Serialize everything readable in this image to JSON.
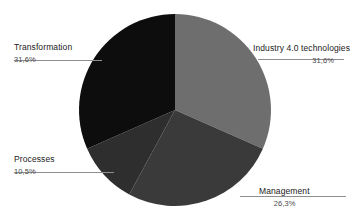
{
  "chart_data": {
    "type": "pie",
    "title": "",
    "labels": [
      "Industry 4.0  technologies",
      "Management",
      "Processes",
      "Transformation"
    ],
    "values": [
      31.6,
      26.3,
      10.5,
      31.6
    ],
    "value_labels": [
      "31,6%",
      "26,3%",
      "10,5%",
      "31,6%"
    ],
    "colors": [
      "#6e6e6e",
      "#3a3a3a",
      "#2e2e2e",
      "#0d0d0d"
    ],
    "start_angle_deg": 0,
    "direction": "clockwise",
    "legend": "none",
    "grid": false,
    "slices": [
      {
        "name": "Industry 4.0  technologies",
        "percent_label": "31,6%",
        "value": 31.6,
        "color": "#6e6e6e",
        "label_position": "right-top"
      },
      {
        "name": "Management",
        "percent_label": "26,3%",
        "value": 26.3,
        "color": "#3a3a3a",
        "label_position": "right-bottom"
      },
      {
        "name": "Processes",
        "percent_label": "10,5%",
        "value": 10.5,
        "color": "#2e2e2e",
        "label_position": "left-bottom"
      },
      {
        "name": "Transformation",
        "percent_label": "31,6%",
        "value": 31.6,
        "color": "#0d0d0d",
        "label_position": "left-top"
      }
    ]
  },
  "canvas": {
    "background": "#ffffff",
    "leader_color": "#8f8f8f"
  }
}
